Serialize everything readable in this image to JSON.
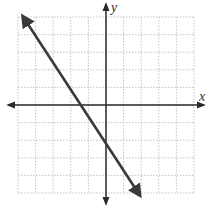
{
  "chart_data": {
    "type": "line",
    "title": "",
    "xlabel": "x",
    "ylabel": "y",
    "xlim": [
      -5,
      5
    ],
    "ylim": [
      -5,
      5
    ],
    "grid": true,
    "grid_style": "dotted",
    "tick_labels": false,
    "series": [
      {
        "name": "line",
        "description": "Straight line with arrowheads at both ends, negative slope",
        "points": [
          [
            -4.7,
            5.0
          ],
          [
            1.9,
            -5.1
          ]
        ],
        "x_intercept": -1.0,
        "y_intercept": -1.6,
        "slope": -1.55,
        "color": "#3a3a3a"
      }
    ]
  },
  "labels": {
    "x_axis": "x",
    "y_axis": "y"
  },
  "colors": {
    "grid": "#b8b8b8",
    "axis": "#2a2a2a",
    "line": "#3a3a3a",
    "background": "#ffffff"
  }
}
